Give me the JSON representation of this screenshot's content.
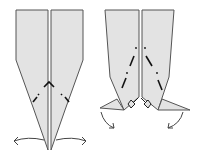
{
  "diagram": {
    "type": "origami-fold-steps",
    "colors": {
      "paper": "#e3e3e3",
      "outline": "#555555",
      "fold_line": "#111111",
      "arrow": "#444444",
      "background": "#ffffff"
    },
    "steps": [
      {
        "id": "step-1",
        "description": "Two long narrow flaps meeting at a point, with mountain-fold lines forming an inverted V near the bottom; curved arrows pull the tips outward."
      },
      {
        "id": "step-2",
        "description": "Flaps shortened with tips reverse-folded outward as small points; diagonal mountain-fold lines shown; curved arrows pointing down and outward."
      }
    ]
  }
}
